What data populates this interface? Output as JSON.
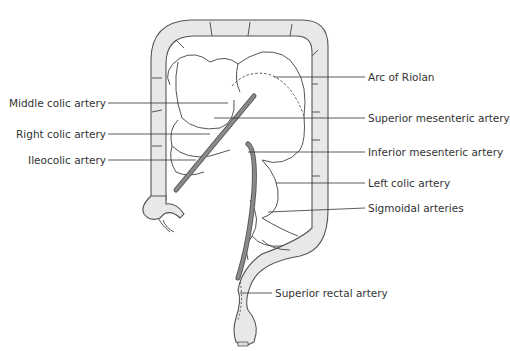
{
  "colors": {
    "colon_fill": "#e6e6e6",
    "colon_stroke": "#555555",
    "artery_fill": "#8a8a8a",
    "vessel_stroke": "#555555",
    "leader_line": "#333333",
    "label_text": "#333333"
  },
  "labels": {
    "left": [
      {
        "id": "middle-colic-artery",
        "text": "Middle colic artery"
      },
      {
        "id": "right-colic-artery",
        "text": "Right colic artery"
      },
      {
        "id": "ileocolic-artery",
        "text": "Ileocolic artery"
      }
    ],
    "right": [
      {
        "id": "arc-of-riolan",
        "text": "Arc of Riolan"
      },
      {
        "id": "superior-mesenteric-artery",
        "text": "Superior mesenteric artery"
      },
      {
        "id": "inferior-mesenteric-artery",
        "text": "Inferior mesenteric artery"
      },
      {
        "id": "left-colic-artery",
        "text": "Left colic artery"
      },
      {
        "id": "sigmoidal-arteries",
        "text": "Sigmoidal arteries"
      },
      {
        "id": "superior-rectal-artery",
        "text": "Superior rectal artery"
      }
    ]
  }
}
